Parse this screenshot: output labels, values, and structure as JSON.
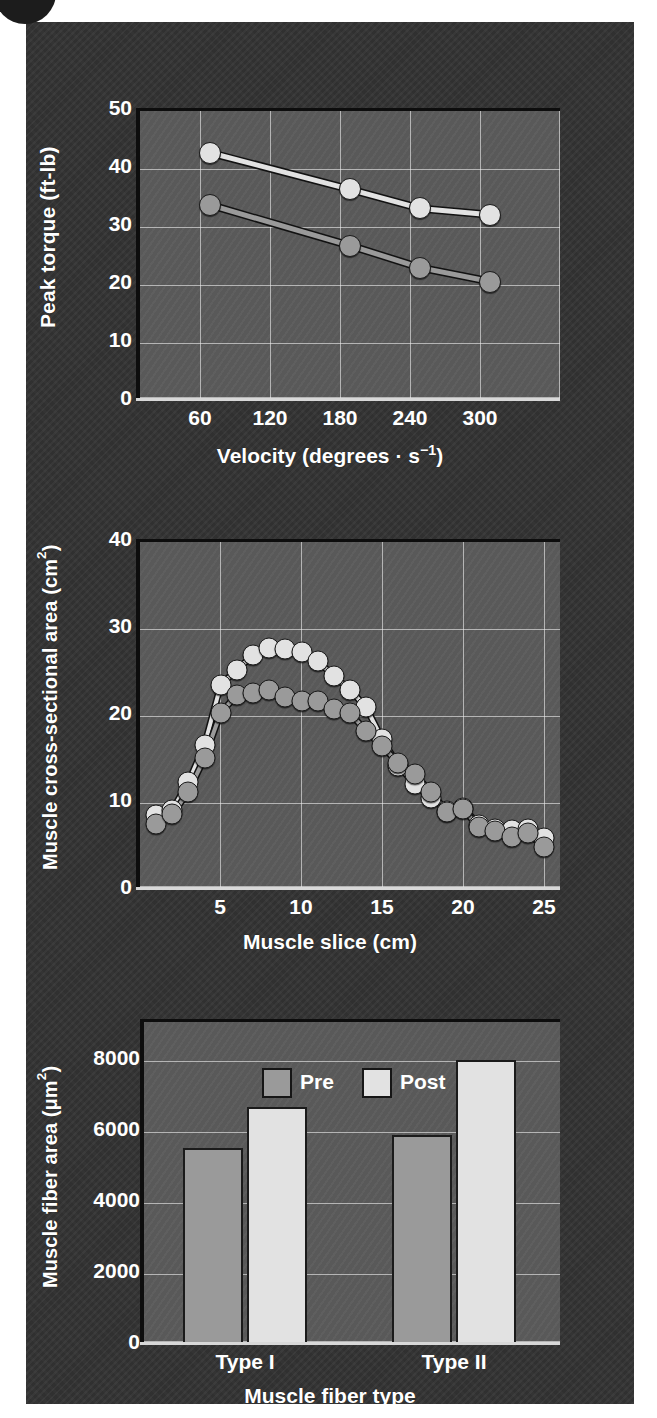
{
  "figure": {
    "background_color": "#333333",
    "plot_background_color": "#5b5b5b",
    "text_color": "#ffffff",
    "pre_color": "#9a9a9a",
    "post_color": "#e2e2e2",
    "gridline_color": "#ebebeb"
  },
  "chart_data": [
    {
      "type": "line",
      "id": "peak-torque-vs-velocity",
      "title": "",
      "xlabel": "Velocity (degrees · s−1)",
      "ylabel": "Peak torque (ft-lb)",
      "xlabel_text": "Velocity (degrees",
      "xlabel_mid": "·",
      "xlabel_unit": "s",
      "xlabel_exp": "−1",
      "xlabel_close": ")",
      "x": [
        60,
        120,
        180,
        240,
        300
      ],
      "xticklabels": [
        "60",
        "120",
        "180",
        "240",
        "300"
      ],
      "yticklabels": [
        "0",
        "10",
        "20",
        "30",
        "40",
        "50"
      ],
      "xlim": [
        0,
        360
      ],
      "ylim": [
        0,
        50
      ],
      "grid": true,
      "legend": "none",
      "series": [
        {
          "name": "Post",
          "color": "#e2e2e2",
          "values": [
            42.8,
            null,
            36.5,
            33.2,
            32.1
          ]
        },
        {
          "name": "Pre",
          "color": "#9a9a9a",
          "values": [
            33.8,
            null,
            26.8,
            23.0,
            20.6
          ]
        }
      ],
      "series_points": [
        {
          "name": "Post",
          "color": "#e2e2e2",
          "x": [
            60,
            180,
            240,
            300
          ],
          "y": [
            42.8,
            36.5,
            33.2,
            32.1
          ]
        },
        {
          "name": "Pre",
          "color": "#9a9a9a",
          "x": [
            60,
            180,
            240,
            300
          ],
          "y": [
            33.8,
            26.8,
            23.0,
            20.6
          ]
        }
      ]
    },
    {
      "type": "line",
      "id": "muscle-csa-vs-slice",
      "title": "",
      "xlabel": "Muscle slice (cm)",
      "ylabel": "Muscle cross-sectional area (cm2)",
      "ylabel_text": "Muscle cross-sectional area (cm",
      "ylabel_exp": "2",
      "ylabel_close": ")",
      "xticklabels": [
        "5",
        "10",
        "15",
        "20",
        "25"
      ],
      "xticks": [
        5,
        10,
        15,
        20,
        25
      ],
      "yticklabels": [
        "0",
        "10",
        "20",
        "30",
        "40"
      ],
      "xlim": [
        0,
        26
      ],
      "ylim": [
        0,
        40
      ],
      "grid": true,
      "legend": "none",
      "series_points": [
        {
          "name": "Post",
          "color": "#e2e2e2",
          "x": [
            1,
            2,
            3,
            4,
            5,
            6,
            7,
            8,
            9,
            10,
            11,
            12,
            13,
            14,
            15,
            16,
            17,
            18,
            19,
            20,
            21,
            22,
            23,
            24,
            25
          ],
          "y": [
            8.6,
            9.2,
            12.4,
            16.7,
            23.6,
            25.3,
            27.0,
            27.8,
            27.7,
            27.3,
            26.3,
            24.6,
            23.0,
            21.0,
            17.3,
            14.3,
            12.2,
            10.6,
            9.1,
            9.4,
            7.5,
            7.0,
            6.9,
            7.0,
            6.0
          ]
        },
        {
          "name": "Pre",
          "color": "#9a9a9a",
          "x": [
            1,
            2,
            3,
            4,
            5,
            6,
            7,
            8,
            9,
            10,
            11,
            12,
            13,
            14,
            15,
            16,
            17,
            18,
            19,
            20,
            21,
            22,
            23,
            24,
            25
          ],
          "y": [
            7.6,
            8.7,
            11.3,
            15.2,
            20.4,
            22.4,
            22.6,
            23.0,
            22.2,
            21.7,
            21.7,
            20.8,
            20.3,
            18.3,
            16.5,
            14.6,
            13.3,
            11.3,
            9.0,
            9.3,
            7.2,
            6.8,
            6.1,
            6.5,
            5.0
          ]
        }
      ]
    },
    {
      "type": "bar",
      "id": "muscle-fiber-area-by-type",
      "title": "",
      "xlabel": "Muscle fiber type",
      "ylabel": "Muscle fiber area (μm2)",
      "ylabel_text": "Muscle fiber area (μm",
      "ylabel_exp": "2",
      "ylabel_close": ")",
      "categories": [
        "Type I",
        "Type II"
      ],
      "yticklabels": [
        "0",
        "2000",
        "4000",
        "6000",
        "8000"
      ],
      "yticks": [
        0,
        2000,
        4000,
        6000,
        8000
      ],
      "ylim": [
        0,
        9000
      ],
      "grid": true,
      "legend": [
        "Pre",
        "Post"
      ],
      "legend_position": "top-center-inside",
      "series": [
        {
          "name": "Pre",
          "color": "#9a9a9a",
          "values": [
            5400,
            5780
          ]
        },
        {
          "name": "Post",
          "color": "#e2e2e2",
          "values": [
            6560,
            7870
          ]
        }
      ]
    }
  ]
}
